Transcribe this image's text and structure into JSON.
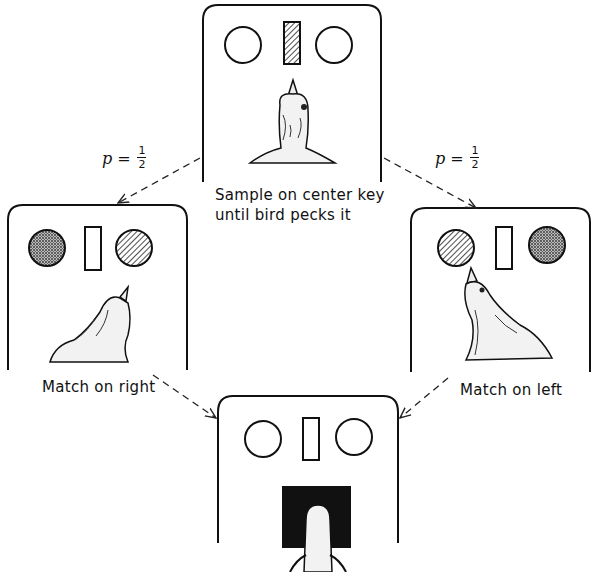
{
  "figure": {
    "panels": [
      {
        "id": "sample",
        "caption": "Sample on center key until bird pecks it",
        "caption_lines": [
          "Sample on center key",
          "until bird pecks it"
        ],
        "keys": {
          "left": "blank",
          "center": "striped",
          "right": "blank"
        }
      },
      {
        "id": "match-right",
        "caption": "Match on right",
        "keys": {
          "left": "dotted",
          "center": "blank",
          "right": "striped"
        }
      },
      {
        "id": "match-left",
        "caption": "Match on left",
        "keys": {
          "left": "striped",
          "center": "blank",
          "right": "dotted"
        }
      },
      {
        "id": "reinforcement",
        "caption": "",
        "keys": {
          "left": "blank",
          "center": "blank",
          "right": "blank"
        },
        "feeder": "open"
      }
    ],
    "transitions": [
      {
        "from": "sample",
        "to": "match-right",
        "label": "p =",
        "numerator": "1",
        "denominator": "2"
      },
      {
        "from": "sample",
        "to": "match-left",
        "label": "p =",
        "numerator": "1",
        "denominator": "2"
      },
      {
        "from": "match-right",
        "to": "reinforcement",
        "label": ""
      },
      {
        "from": "match-left",
        "to": "reinforcement",
        "label": ""
      }
    ]
  }
}
